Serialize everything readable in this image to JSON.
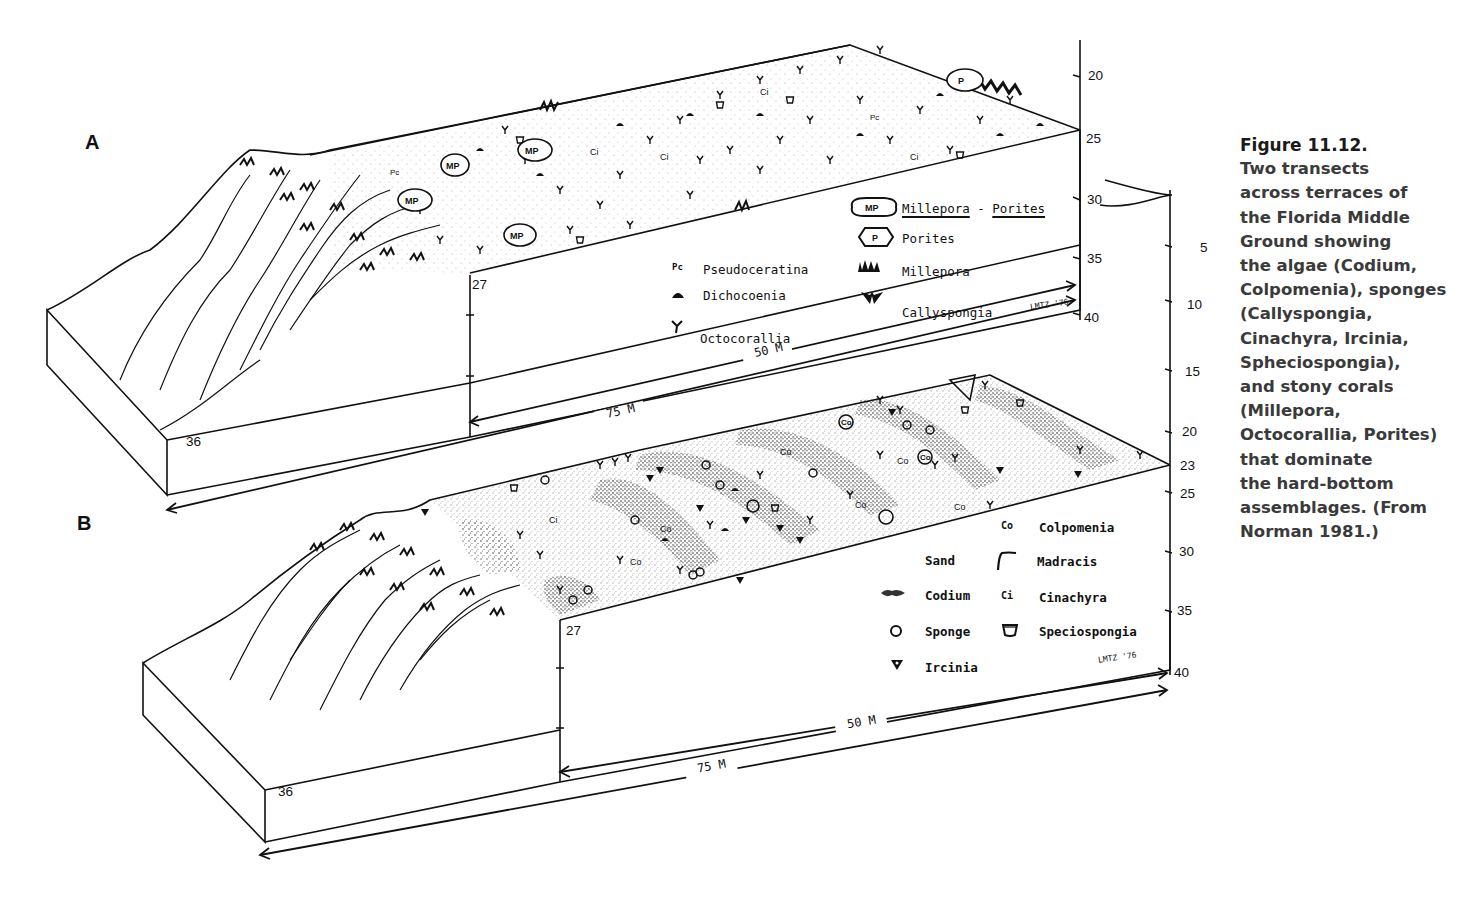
{
  "figure": {
    "caption_title": "Figure 11.12.",
    "caption_lines": [
      "Two transects",
      "across terraces of",
      "the Florida Middle",
      "Ground showing",
      "the algae (Codium,",
      "Colpomenia), sponges",
      "(Callyspongia,",
      "Cinachyra, Ircinia,",
      "Spheciospongia),",
      "and stony corals",
      "(Millepora,",
      "Octocorallia, Porites)",
      "that dominate",
      "the hard-bottom",
      "assemblages. (From",
      "Norman 1981.)"
    ]
  },
  "panel_a": {
    "letter": "A",
    "depth_labels_front": [
      "36",
      "27"
    ],
    "right_axis_ticks": [
      "20",
      "25",
      "30",
      "35",
      "40"
    ],
    "distance_labels": [
      "50 M",
      "75 M"
    ],
    "signature": "LMTZ '76",
    "legend": {
      "left": [
        {
          "symbol": "Pc",
          "label": "Pseudoceratina",
          "underline": true
        },
        {
          "symbol": "dome",
          "label": "Dichocoenia",
          "underline": true
        },
        {
          "symbol": "Y",
          "label": "Octocorallia",
          "underline": false
        }
      ],
      "right": [
        {
          "symbol": "MP",
          "label_a": "Millepora",
          "sep": " - ",
          "label_b": "Porites",
          "underline": true
        },
        {
          "symbol": "P",
          "label": "Porites",
          "underline": true
        },
        {
          "symbol": "millepora-glyph",
          "label": "Millepora",
          "underline": true
        },
        {
          "symbol": "callyspongia-glyph",
          "label": "Callyspongia",
          "underline": true
        }
      ]
    }
  },
  "panel_b": {
    "letter": "B",
    "depth_labels_front": [
      "36",
      "27"
    ],
    "right_axis_ticks": [
      "5",
      "10",
      "15",
      "20",
      "23",
      "25",
      "30",
      "35",
      "40"
    ],
    "distance_labels": [
      "50 M",
      "75 M"
    ],
    "signature": "LMTZ '76",
    "legend": {
      "col1": [
        {
          "symbol": "",
          "label": "Sand",
          "underline": false
        },
        {
          "symbol": "codium-glyph",
          "label": "Codium",
          "underline": true
        },
        {
          "symbol": "O",
          "label": "Sponge",
          "underline": false
        },
        {
          "symbol": "ircinia-glyph",
          "label": "Ircinia",
          "underline": true
        }
      ],
      "col2": [
        {
          "symbol": "Co",
          "label": "Colpomenia",
          "underline": true
        },
        {
          "symbol": "madracis-glyph",
          "label": "Madracis",
          "underline": true
        },
        {
          "symbol": "Ci",
          "label": "Cinachyra",
          "underline": true
        },
        {
          "symbol": "speciospongia-glyph",
          "label": "Speciospongia",
          "underline": true
        }
      ]
    }
  },
  "colors": {
    "ink": "#111111",
    "caption_text": "#3a3a3a",
    "background": "#ffffff"
  }
}
